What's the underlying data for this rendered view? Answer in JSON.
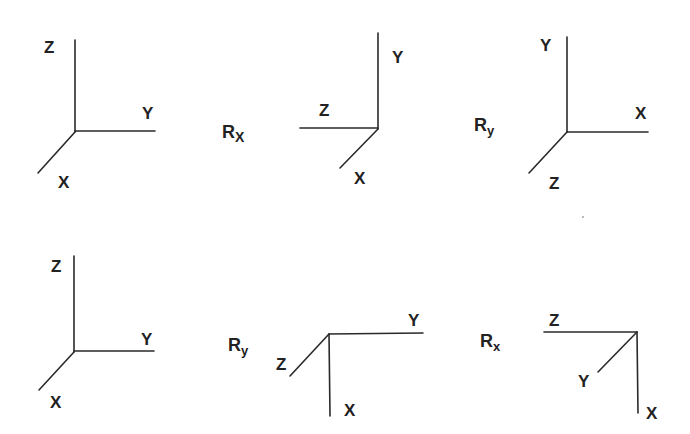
{
  "diagram": {
    "rows": [
      {
        "frames": [
          {
            "axes": {
              "up": "Z",
              "right": "Y",
              "diag": "X"
            }
          },
          {
            "axes": {
              "up": "Y",
              "left": "Z",
              "diag": "X"
            }
          },
          {
            "axes": {
              "up": "Y",
              "right": "X",
              "diag": "Z"
            }
          }
        ],
        "operators": [
          {
            "base": "R",
            "sub": "X"
          },
          {
            "base": "R",
            "sub": "y"
          }
        ]
      },
      {
        "frames": [
          {
            "axes": {
              "up": "Z",
              "right": "Y",
              "diag": "X"
            }
          },
          {
            "axes": {
              "right": "Y",
              "down": "X",
              "diag": "Z"
            }
          },
          {
            "axes": {
              "left": "Z",
              "down": "X",
              "diag": "Y"
            }
          }
        ],
        "operators": [
          {
            "base": "R",
            "sub": "y"
          },
          {
            "base": "R",
            "sub": "x"
          }
        ]
      }
    ]
  },
  "labels": {
    "f1": {
      "z": "Z",
      "y": "Y",
      "x": "X"
    },
    "f2": {
      "y": "Y",
      "z": "Z",
      "x": "X"
    },
    "f3": {
      "y": "Y",
      "x": "X",
      "z": "Z"
    },
    "f4": {
      "z": "Z",
      "y": "Y",
      "x": "X"
    },
    "f5": {
      "y": "Y",
      "z": "Z",
      "x": "X"
    },
    "f6": {
      "z": "Z",
      "y": "Y",
      "x": "X"
    },
    "op1": {
      "base": "R",
      "sub": "X"
    },
    "op2": {
      "base": "R",
      "sub": "y"
    },
    "op3": {
      "base": "R",
      "sub": "y"
    },
    "op4": {
      "base": "R",
      "sub": "x"
    }
  }
}
